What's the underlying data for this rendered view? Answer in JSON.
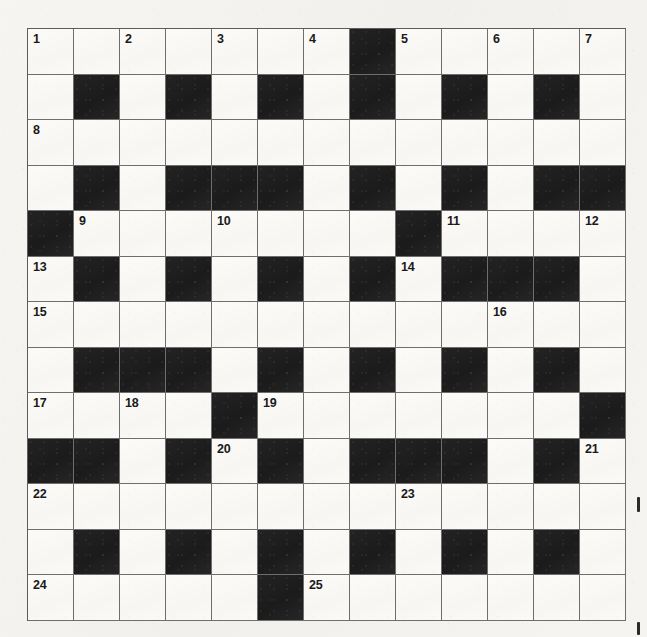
{
  "puzzle": {
    "title": "Crossword Grid",
    "type": "crossword",
    "rows": 13,
    "columns": 13,
    "cell_size_px": 46,
    "colors": {
      "paper": "#f4f3f0",
      "white_cell": "#fbfaf7",
      "black_cell": "#1f1f1f",
      "grid_line": "#6e6e6e",
      "number_text": "#1a1a1a"
    },
    "legend": {
      "W": "white open cell",
      "B": "black blocked cell"
    },
    "grid": [
      [
        "W",
        "W",
        "W",
        "W",
        "W",
        "W",
        "W",
        "B",
        "W",
        "W",
        "W",
        "W",
        "W"
      ],
      [
        "W",
        "B",
        "W",
        "B",
        "W",
        "B",
        "W",
        "B",
        "W",
        "B",
        "W",
        "B",
        "W"
      ],
      [
        "W",
        "W",
        "W",
        "W",
        "W",
        "W",
        "W",
        "W",
        "W",
        "W",
        "W",
        "W",
        "W"
      ],
      [
        "W",
        "B",
        "W",
        "B",
        "B",
        "B",
        "W",
        "B",
        "W",
        "B",
        "W",
        "B",
        "B"
      ],
      [
        "B",
        "W",
        "W",
        "W",
        "W",
        "W",
        "W",
        "W",
        "B",
        "W",
        "W",
        "W",
        "W"
      ],
      [
        "W",
        "B",
        "W",
        "B",
        "W",
        "B",
        "W",
        "B",
        "W",
        "B",
        "B",
        "B",
        "W"
      ],
      [
        "W",
        "W",
        "W",
        "W",
        "W",
        "W",
        "W",
        "W",
        "W",
        "W",
        "W",
        "W",
        "W"
      ],
      [
        "W",
        "B",
        "B",
        "B",
        "W",
        "B",
        "W",
        "B",
        "W",
        "B",
        "W",
        "B",
        "W"
      ],
      [
        "W",
        "W",
        "W",
        "W",
        "B",
        "W",
        "W",
        "W",
        "W",
        "W",
        "W",
        "W",
        "B"
      ],
      [
        "B",
        "B",
        "W",
        "B",
        "W",
        "B",
        "W",
        "B",
        "B",
        "B",
        "W",
        "B",
        "W"
      ],
      [
        "W",
        "W",
        "W",
        "W",
        "W",
        "W",
        "W",
        "W",
        "W",
        "W",
        "W",
        "W",
        "W"
      ],
      [
        "W",
        "B",
        "W",
        "B",
        "W",
        "B",
        "W",
        "B",
        "W",
        "B",
        "W",
        "B",
        "W"
      ],
      [
        "W",
        "W",
        "W",
        "W",
        "W",
        "B",
        "W",
        "W",
        "W",
        "W",
        "W",
        "W",
        "W"
      ]
    ],
    "numbers": [
      {
        "n": "1",
        "row": 1,
        "col": 1
      },
      {
        "n": "2",
        "row": 1,
        "col": 3
      },
      {
        "n": "3",
        "row": 1,
        "col": 5
      },
      {
        "n": "4",
        "row": 1,
        "col": 7
      },
      {
        "n": "5",
        "row": 1,
        "col": 9
      },
      {
        "n": "6",
        "row": 1,
        "col": 11
      },
      {
        "n": "7",
        "row": 1,
        "col": 13
      },
      {
        "n": "8",
        "row": 3,
        "col": 1
      },
      {
        "n": "9",
        "row": 5,
        "col": 2
      },
      {
        "n": "10",
        "row": 5,
        "col": 5
      },
      {
        "n": "11",
        "row": 5,
        "col": 10
      },
      {
        "n": "12",
        "row": 5,
        "col": 13
      },
      {
        "n": "13",
        "row": 6,
        "col": 1
      },
      {
        "n": "14",
        "row": 6,
        "col": 9
      },
      {
        "n": "15",
        "row": 7,
        "col": 1
      },
      {
        "n": "16",
        "row": 7,
        "col": 11
      },
      {
        "n": "17",
        "row": 9,
        "col": 1
      },
      {
        "n": "18",
        "row": 9,
        "col": 3
      },
      {
        "n": "19",
        "row": 9,
        "col": 6
      },
      {
        "n": "20",
        "row": 10,
        "col": 5
      },
      {
        "n": "21",
        "row": 10,
        "col": 13
      },
      {
        "n": "22",
        "row": 11,
        "col": 1
      },
      {
        "n": "23",
        "row": 11,
        "col": 9
      },
      {
        "n": "24",
        "row": 13,
        "col": 1
      },
      {
        "n": "25",
        "row": 13,
        "col": 7
      }
    ]
  }
}
